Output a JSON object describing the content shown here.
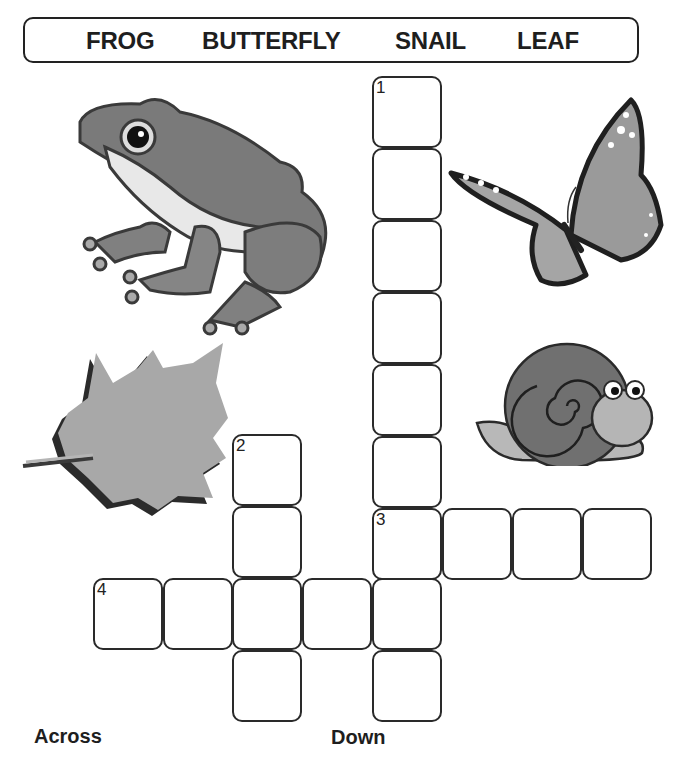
{
  "word_bank": {
    "words": [
      "FROG",
      "BUTTERFLY",
      "SNAIL",
      "LEAF"
    ]
  },
  "clues": {
    "across_label": "Across",
    "down_label": "Down"
  },
  "grid": {
    "cell_size": [
      70,
      72
    ],
    "numbers": {
      "1": "1",
      "2": "2",
      "3": "3",
      "4": "4"
    },
    "entries": [
      {
        "number": "1",
        "direction": "down",
        "length": 9,
        "start_col": 4,
        "start_row": 0
      },
      {
        "number": "2",
        "direction": "down",
        "length": 4,
        "start_col": 2,
        "start_row": 5
      },
      {
        "number": "3",
        "direction": "across",
        "length": 4,
        "start_col": 4,
        "start_row": 6
      },
      {
        "number": "4",
        "direction": "across",
        "length": 5,
        "start_col": 0,
        "start_row": 7
      }
    ]
  },
  "pictures": [
    {
      "name": "frog",
      "icon": "frog-icon"
    },
    {
      "name": "butterfly",
      "icon": "butterfly-icon"
    },
    {
      "name": "leaf",
      "icon": "leaf-icon"
    },
    {
      "name": "snail",
      "icon": "snail-icon"
    }
  ],
  "colors": {
    "border": "#2a2a2a",
    "text": "#1e1e1e",
    "frog_body": "#7a7a7a",
    "frog_belly": "#e8e8e8",
    "butterfly_wing": "#9a9a9a",
    "butterfly_edge": "#1f1f1f",
    "leaf": "#a8a8a8",
    "snail_shell": "#707070",
    "snail_body": "#b8b8b8"
  }
}
